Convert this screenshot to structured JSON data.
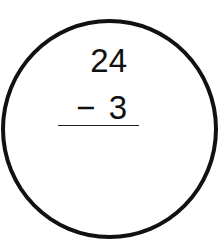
{
  "problem": {
    "minuend": "24",
    "operator": "−",
    "subtrahend": "3",
    "answer": ""
  },
  "colors": {
    "stroke": "#111111",
    "background": "#ffffff"
  }
}
